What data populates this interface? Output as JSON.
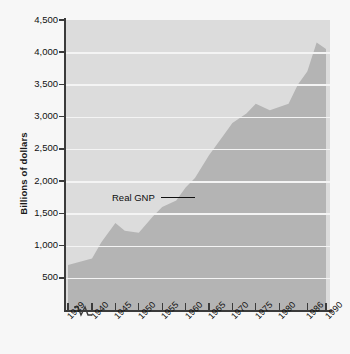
{
  "chart_data": {
    "type": "area",
    "title": "",
    "xlabel": "",
    "ylabel": "Billions of dollars",
    "series_name": "Real GNP",
    "ylim": [
      0,
      4500
    ],
    "y_ticks": [
      4500,
      4000,
      3500,
      3000,
      2500,
      2000,
      1500,
      1000,
      500
    ],
    "y_tick_labels": [
      "4,500",
      "4,000",
      "3,500",
      "3,000",
      "2,500",
      "2,000",
      "1,500",
      "1,000",
      "500"
    ],
    "x_tick_labels": [
      "1929",
      "1940",
      "1945",
      "1950",
      "1955",
      "1960",
      "1965",
      "1970",
      "1975",
      "1980",
      "1986",
      "1990"
    ],
    "x_axis_break_after": "1929",
    "grid": true,
    "legend": "annotation",
    "annotations": [
      {
        "text": "Real GNP",
        "style": "leader-line"
      }
    ],
    "categories": [
      1929,
      1940,
      1945,
      1950,
      1955,
      1960,
      1965,
      1970,
      1975,
      1980,
      1986,
      1990
    ],
    "values": [
      700,
      800,
      1350,
      1200,
      1600,
      1900,
      2400,
      2900,
      3200,
      3150,
      3700,
      4050
    ],
    "points": [
      {
        "x": 1929,
        "y": 700
      },
      {
        "x": 1940,
        "y": 800
      },
      {
        "x": 1942,
        "y": 1050
      },
      {
        "x": 1945,
        "y": 1350
      },
      {
        "x": 1947,
        "y": 1230
      },
      {
        "x": 1950,
        "y": 1200
      },
      {
        "x": 1953,
        "y": 1450
      },
      {
        "x": 1955,
        "y": 1600
      },
      {
        "x": 1958,
        "y": 1700
      },
      {
        "x": 1960,
        "y": 1900
      },
      {
        "x": 1962,
        "y": 2050
      },
      {
        "x": 1965,
        "y": 2400
      },
      {
        "x": 1968,
        "y": 2700
      },
      {
        "x": 1970,
        "y": 2900
      },
      {
        "x": 1973,
        "y": 3050
      },
      {
        "x": 1975,
        "y": 3200
      },
      {
        "x": 1978,
        "y": 3100
      },
      {
        "x": 1980,
        "y": 3150
      },
      {
        "x": 1982,
        "y": 3200
      },
      {
        "x": 1984,
        "y": 3500
      },
      {
        "x": 1986,
        "y": 3700
      },
      {
        "x": 1988,
        "y": 4150
      },
      {
        "x": 1990,
        "y": 4050
      }
    ],
    "colors": {
      "page_background": "#f7f7f7",
      "plot_background": "#dcdcdc",
      "area_fill": "#b4b4b4",
      "gridline": "#f4f4f4",
      "axis": "#3b3b3b",
      "text": "#111111"
    }
  }
}
